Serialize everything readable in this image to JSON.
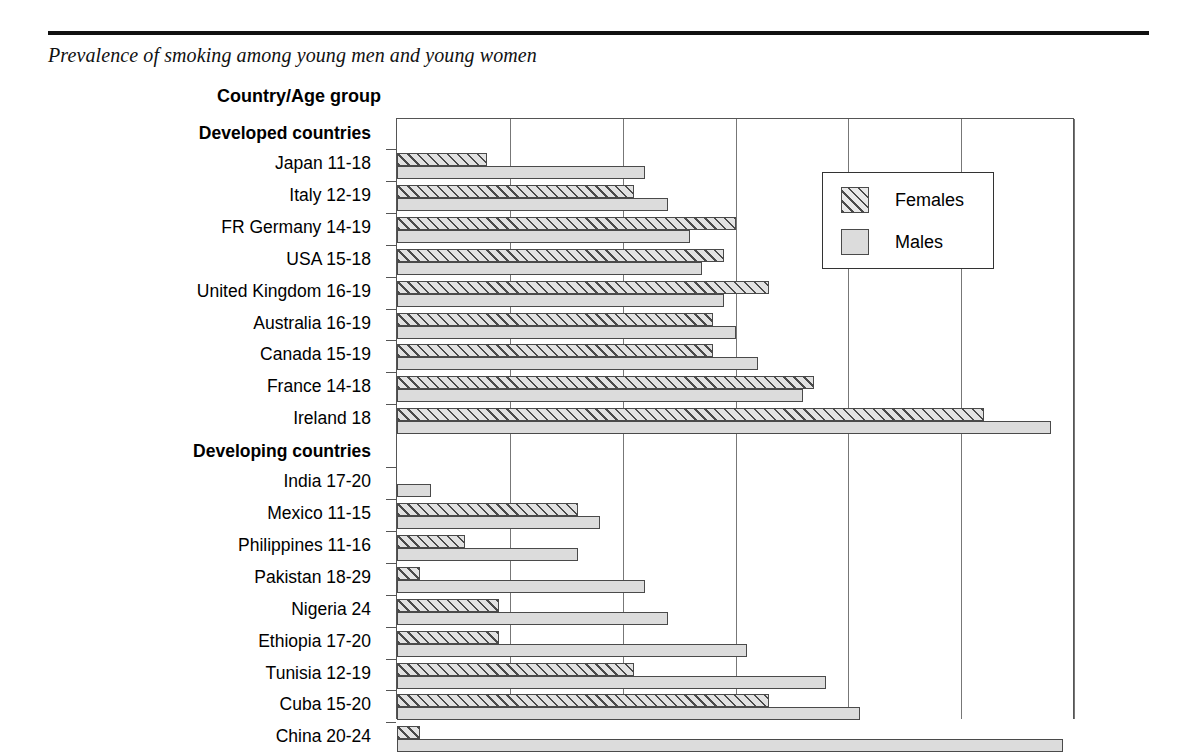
{
  "title": "Prevalence of smoking among young men and young women",
  "column_header": "Country/Age group",
  "legend": {
    "females": "Females",
    "males": "Males"
  },
  "colors": {
    "female_hatch": "#4a4a4a",
    "male_fill": "#dcdcdc",
    "grid": "#777777",
    "rule": "#111111"
  },
  "chart_data": {
    "type": "bar",
    "orientation": "horizontal",
    "title": "Prevalence of smoking among young men and young women",
    "xlabel": "",
    "ylabel": "Country/Age group",
    "xlim": [
      0,
      60
    ],
    "xticks": [
      0,
      10,
      20,
      30,
      40,
      50,
      60
    ],
    "grid": true,
    "legend_position": "upper right",
    "series": [
      {
        "name": "Females",
        "values": [
          8,
          21,
          30,
          29,
          33,
          28,
          28,
          37,
          52,
          0,
          16,
          6,
          2,
          9,
          9,
          21,
          33,
          2
        ]
      },
      {
        "name": "Males",
        "values": [
          22,
          24,
          26,
          27,
          29,
          30,
          32,
          36,
          58,
          3,
          18,
          16,
          22,
          24,
          31,
          38,
          41,
          59
        ]
      }
    ],
    "groups": [
      {
        "label": "Developed countries",
        "categories": [
          "Japan 11-18",
          "Italy 12-19",
          "FR Germany 14-19",
          "USA 15-18",
          "United Kingdom 16-19",
          "Australia 16-19",
          "Canada 15-19",
          "France 14-18",
          "Ireland      18"
        ]
      },
      {
        "label": "Developing countries",
        "categories": [
          "India 17-20",
          "Mexico 11-15",
          "Philippines 11-16",
          "Pakistan 18-29",
          "Nigeria      24",
          "Ethiopia 17-20",
          "Tunisia 12-19",
          "Cuba 15-20",
          "China 20-24"
        ]
      }
    ],
    "categories": [
      "Japan 11-18",
      "Italy 12-19",
      "FR Germany 14-19",
      "USA 15-18",
      "United Kingdom 16-19",
      "Australia 16-19",
      "Canada 15-19",
      "France 14-18",
      "Ireland      18",
      "India 17-20",
      "Mexico 11-15",
      "Philippines 11-16",
      "Pakistan 18-29",
      "Nigeria      24",
      "Ethiopia 17-20",
      "Tunisia 12-19",
      "Cuba 15-20",
      "China 20-24"
    ]
  }
}
